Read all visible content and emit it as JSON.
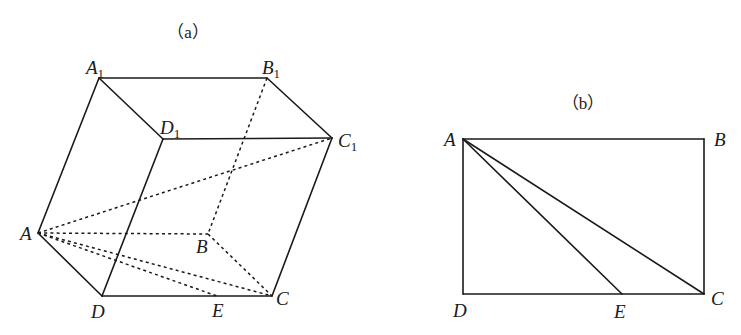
{
  "figure_a": {
    "caption": "（a）",
    "points": {
      "A1": {
        "label": "A",
        "sub": "1",
        "x": 99,
        "y": 78
      },
      "B1": {
        "label": "B",
        "sub": "1",
        "x": 267,
        "y": 78
      },
      "C1": {
        "label": "C",
        "sub": "1",
        "x": 332,
        "y": 138
      },
      "D1": {
        "label": "D",
        "sub": "1",
        "x": 163,
        "y": 139
      },
      "A": {
        "label": "A",
        "x": 38,
        "y": 233
      },
      "B": {
        "label": "B",
        "x": 208,
        "y": 234
      },
      "C": {
        "label": "C",
        "x": 272,
        "y": 296
      },
      "D": {
        "label": "D",
        "x": 102,
        "y": 296
      },
      "E": {
        "label": "E",
        "x": 217,
        "y": 296
      }
    },
    "solid_edges": [
      "A1-B1",
      "B1-C1",
      "C1-D1",
      "D1-A1",
      "A1-A",
      "D1-D",
      "C1-C",
      "A-D",
      "D-C"
    ],
    "dashed_edges": [
      "B1-B",
      "A-C1",
      "A-B",
      "A-C",
      "A-E",
      "B-C"
    ]
  },
  "figure_b": {
    "caption": "（b）",
    "points": {
      "A": {
        "label": "A",
        "x": 463,
        "y": 139
      },
      "B": {
        "label": "B",
        "x": 704,
        "y": 139
      },
      "C": {
        "label": "C",
        "x": 704,
        "y": 294
      },
      "D": {
        "label": "D",
        "x": 463,
        "y": 294
      },
      "E": {
        "label": "E",
        "x": 622,
        "y": 294
      }
    },
    "solid_edges": [
      "A-B",
      "B-C",
      "C-D",
      "D-A",
      "A-E",
      "A-C"
    ]
  }
}
